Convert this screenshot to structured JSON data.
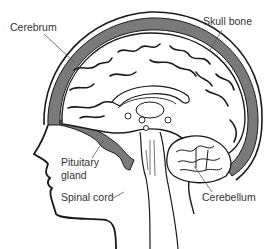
{
  "diagram": {
    "labels": {
      "cerebrum": "Cerebrum",
      "skull_bone": "Skull bone",
      "pituitary_line1": "Pituitary",
      "pituitary_line2": "gland",
      "spinal_cord": "Spinal cord",
      "cerebellum": "Cerebellum"
    },
    "colors": {
      "skull": "#7a7a7a",
      "outline": "#1a1a1a",
      "label_text": "#333333",
      "leader_line": "#555555",
      "background": "#ffffff"
    }
  }
}
